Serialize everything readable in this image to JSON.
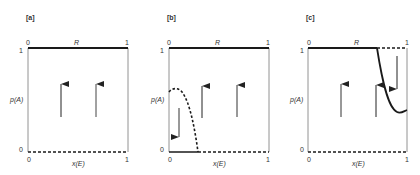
{
  "figure": {
    "panels": [
      {
        "tag": "[a]",
        "top_left": "0",
        "top_label": "R",
        "top_right": "1",
        "y_top": "1",
        "y_label": "p(A)",
        "y_bottom": "0",
        "bottom_left": "0",
        "x_label": "x(E)",
        "bottom_right": "1"
      },
      {
        "tag": "[b]",
        "top_left": "0",
        "top_label": "R",
        "top_right": "1",
        "y_top": "1",
        "y_label": "p(A)",
        "y_bottom": "0",
        "bottom_left": "0",
        "x_label": "x(E)",
        "bottom_right": "1"
      },
      {
        "tag": "[c]",
        "top_left": "0",
        "top_label": "R",
        "top_right": "1",
        "y_top": "1",
        "y_label": "p(A)",
        "y_bottom": "0",
        "bottom_left": "0",
        "x_label": "x(E)",
        "bottom_right": "1"
      }
    ],
    "colors": {
      "line": "#1a1a1a",
      "axis": "#555555",
      "arrow": "#222222"
    }
  }
}
